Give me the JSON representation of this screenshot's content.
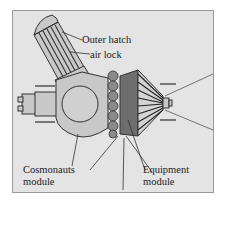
{
  "diagram": {
    "labels": {
      "outer_hatch": "Outer hatch",
      "air_lock": "air lock",
      "cosmonauts_line1": "Cosmonauts",
      "cosmonauts_line2": "module",
      "equipment_line1": "Equipment",
      "equipment_line2": "module"
    },
    "colors": {
      "background": "#e4e4e4",
      "frame": "#9a9a9a",
      "module_fill": "#c8c8c8",
      "equipment_fill": "#6e6e6e",
      "ring_fill": "#8a8a8a",
      "stroke": "#333333"
    }
  }
}
